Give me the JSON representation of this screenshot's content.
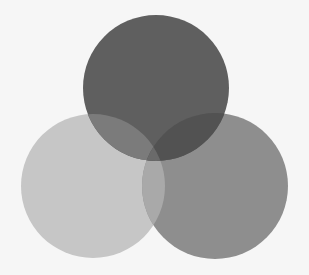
{
  "diagram": {
    "type": "venn-3",
    "background": "#f6f6f6",
    "circles": [
      {
        "id": "top",
        "cx": 156,
        "cy": 88,
        "r": 73,
        "fill": "#5f5f5f"
      },
      {
        "id": "left",
        "cx": 93,
        "cy": 186,
        "r": 72,
        "fill": "#c6c6c6"
      },
      {
        "id": "right",
        "cx": 215,
        "cy": 186,
        "r": 73,
        "fill": "#8e8e8e"
      }
    ],
    "overlaps": {
      "top_left": "#7b7b7b",
      "top_right": "#525252",
      "left_right": "#a9a9a9",
      "all": "#6a6a6a"
    }
  }
}
